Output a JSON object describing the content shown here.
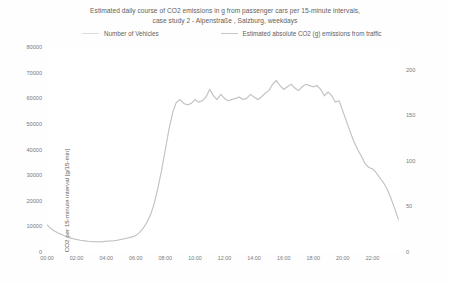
{
  "chart_data": {
    "type": "line",
    "title": "Estimated daily course of CO2 emissions in g from passenger cars per 15-minute intervals, case study 2 - Alpenstraße , Salzburg, weekdays",
    "title_line1": "Estimated daily course of CO2 emissions in g from passenger cars per 15-minute intervals,",
    "title_line2": "case study 2 - Alpenstraße , Salzburg, weekdays",
    "xlabel": "",
    "ylabel": "CO2 per 15-minute interval [g/15-min]",
    "y2label": "Average number of vehicles per 15-minute interval [n/15-min]",
    "grid": false,
    "legend_position": "top",
    "legend": [
      {
        "name": "Number of Vehicles",
        "color": "#dcdcdc",
        "axis": "right"
      },
      {
        "name": "Estimated absolute CO2 (g) emissions from traffic",
        "color": "#c6c6c6",
        "axis": "left"
      }
    ],
    "xlim": [
      0,
      24
    ],
    "ylim": [
      0,
      80000
    ],
    "y2lim": [
      0,
      225
    ],
    "xticks": [
      "00:00",
      "02:00",
      "04:00",
      "06:00",
      "08:00",
      "10:00",
      "12:00",
      "14:00",
      "16:00",
      "18:00",
      "20:00",
      "22:00"
    ],
    "xtick_values": [
      0,
      2,
      4,
      6,
      8,
      10,
      12,
      14,
      16,
      18,
      20,
      22
    ],
    "yticks": [
      0,
      10000,
      20000,
      30000,
      40000,
      50000,
      60000,
      70000,
      80000
    ],
    "ytick_labels": [
      "0",
      "10000",
      "20000",
      "30000",
      "40000",
      "50000",
      "60000",
      "70000",
      "80000"
    ],
    "y2ticks": [
      0,
      50,
      100,
      150,
      200
    ],
    "y2tick_labels": [
      "0",
      "50",
      "100",
      "150",
      "200"
    ],
    "x": [
      0,
      0.25,
      0.5,
      0.75,
      1,
      1.25,
      1.5,
      1.75,
      2,
      2.25,
      2.5,
      2.75,
      3,
      3.25,
      3.5,
      3.75,
      4,
      4.25,
      4.5,
      4.75,
      5,
      5.25,
      5.5,
      5.75,
      6,
      6.25,
      6.5,
      6.75,
      7,
      7.25,
      7.5,
      7.75,
      8,
      8.25,
      8.5,
      8.75,
      9,
      9.25,
      9.5,
      9.75,
      10,
      10.25,
      10.5,
      10.75,
      11,
      11.25,
      11.5,
      11.75,
      12,
      12.25,
      12.5,
      12.75,
      13,
      13.25,
      13.5,
      13.75,
      14,
      14.25,
      14.5,
      14.75,
      15,
      15.25,
      15.5,
      15.75,
      16,
      16.25,
      16.5,
      16.75,
      17,
      17.25,
      17.5,
      17.75,
      18,
      18.25,
      18.5,
      18.75,
      19,
      19.25,
      19.5,
      19.75,
      20,
      20.25,
      20.5,
      20.75,
      21,
      21.25,
      21.5,
      21.75,
      22,
      22.25,
      22.5,
      22.75,
      23,
      23.25,
      23.5,
      23.75
    ],
    "series": [
      {
        "name": "Estimated absolute CO2 (g) emissions from traffic",
        "color": "#c2c2c2",
        "axis": "left",
        "unit": "g/15-min",
        "values": [
          10600,
          9200,
          8200,
          7400,
          6800,
          6200,
          5600,
          5200,
          4900,
          4600,
          4400,
          4200,
          4100,
          4000,
          4000,
          4050,
          4200,
          4300,
          4400,
          4600,
          4900,
          5200,
          5500,
          5900,
          6400,
          7600,
          9300,
          11500,
          14500,
          19000,
          25000,
          32000,
          40000,
          48000,
          54500,
          58500,
          59500,
          58000,
          57500,
          58000,
          59500,
          58500,
          59000,
          60500,
          63500,
          61000,
          59500,
          61500,
          60000,
          59000,
          59500,
          60000,
          60500,
          59500,
          60000,
          61500,
          60500,
          59500,
          60500,
          62000,
          63000,
          65500,
          67000,
          65000,
          63500,
          64500,
          65500,
          64000,
          63000,
          64500,
          65500,
          65000,
          64500,
          65000,
          63500,
          61000,
          62500,
          61000,
          58500,
          59000,
          55000,
          51000,
          47000,
          43000,
          40000,
          37500,
          34500,
          33000,
          32500,
          31000,
          29000,
          27000,
          24500,
          21000,
          17000,
          12800
        ]
      },
      {
        "name": "Number of Vehicles",
        "color": "#ededed",
        "axis": "right",
        "unit": "n/15-min",
        "values": [
          30,
          26,
          23,
          21,
          19,
          17,
          16,
          15,
          14,
          13,
          12,
          12,
          11,
          11,
          11,
          11,
          12,
          12,
          12,
          13,
          14,
          15,
          16,
          17,
          18,
          21,
          26,
          32,
          41,
          53,
          70,
          90,
          112,
          135,
          153,
          164,
          167,
          163,
          161,
          163,
          167,
          164,
          166,
          170,
          178,
          171,
          167,
          173,
          168,
          166,
          167,
          168,
          170,
          167,
          168,
          173,
          170,
          167,
          170,
          174,
          177,
          184,
          188,
          182,
          178,
          181,
          184,
          180,
          177,
          181,
          184,
          182,
          181,
          182,
          178,
          171,
          175,
          171,
          164,
          166,
          154,
          143,
          132,
          121,
          112,
          105,
          97,
          93,
          91,
          87,
          81,
          76,
          69,
          59,
          48,
          36
        ]
      }
    ]
  }
}
